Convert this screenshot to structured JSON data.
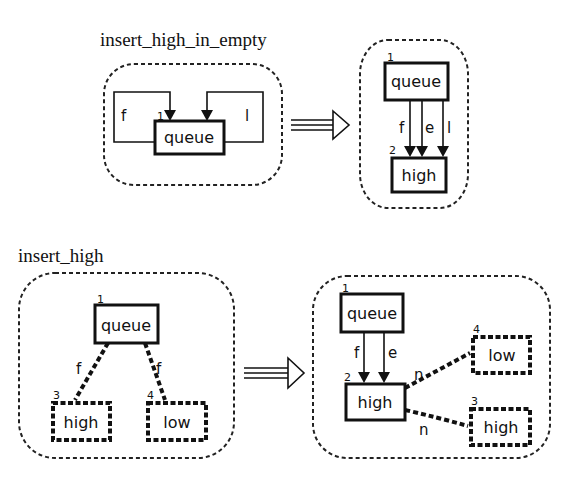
{
  "rules": [
    {
      "title": "insert_high_in_empty",
      "lhs": {
        "nodes": [
          {
            "id": "1",
            "label": "queue"
          }
        ],
        "edges": [
          {
            "label": "f"
          },
          {
            "label": "l"
          }
        ]
      },
      "rhs": {
        "nodes": [
          {
            "id": "1",
            "label": "queue"
          },
          {
            "id": "2",
            "label": "high"
          }
        ],
        "edges": [
          {
            "label": "f"
          },
          {
            "label": "e"
          },
          {
            "label": "l"
          }
        ]
      }
    },
    {
      "title": "insert_high",
      "lhs": {
        "nodes": [
          {
            "id": "1",
            "label": "queue"
          },
          {
            "id": "3",
            "label": "high"
          },
          {
            "id": "4",
            "label": "low"
          }
        ],
        "edges": [
          {
            "label": "f"
          },
          {
            "label": "f"
          }
        ]
      },
      "rhs": {
        "nodes": [
          {
            "id": "1",
            "label": "queue"
          },
          {
            "id": "2",
            "label": "high"
          },
          {
            "id": "4",
            "label": "low"
          },
          {
            "id": "3",
            "label": "high"
          }
        ],
        "edges": [
          {
            "label": "f"
          },
          {
            "label": "e"
          },
          {
            "label": "n"
          },
          {
            "label": "n"
          }
        ]
      }
    }
  ]
}
